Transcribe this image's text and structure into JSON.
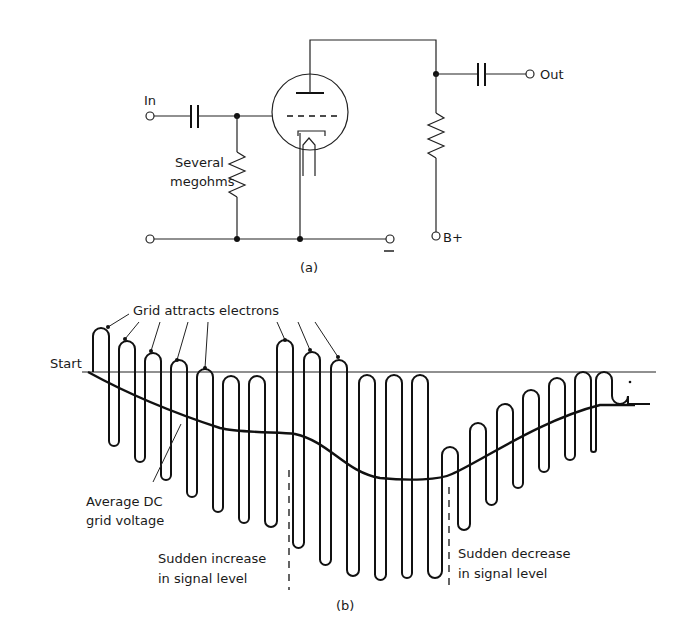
{
  "figure_a": {
    "caption": "(a)",
    "labels": {
      "input": "In",
      "output": "Out",
      "supply": "B+",
      "ground": "−",
      "grid_resistor": [
        "Several",
        "megohms"
      ]
    },
    "components": [
      "input-coupling-capacitor",
      "grid-leak-resistor",
      "triode-tube",
      "plate-load-resistor",
      "output-coupling-capacitor"
    ]
  },
  "figure_b": {
    "caption": "(b)",
    "labels": {
      "start": "Start",
      "grid_attracts": "Grid attracts electrons",
      "avg_dc": [
        "Average DC",
        "grid voltage"
      ],
      "sudden_increase": [
        "Sudden increase",
        "in signal level"
      ],
      "sudden_decrease": [
        "Sudden decrease",
        "in signal level"
      ]
    }
  }
}
